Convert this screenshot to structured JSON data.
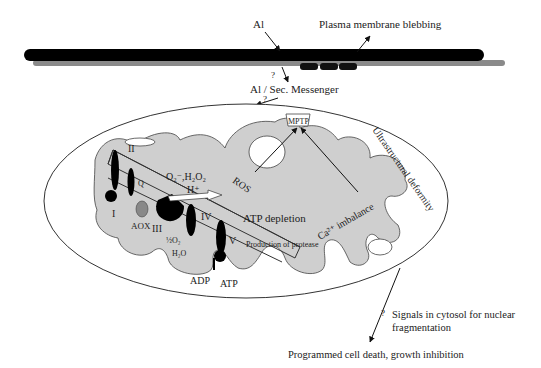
{
  "labels": {
    "al": "Al",
    "plasma_membrane_blebbing": "Plasma membrane blebbing",
    "q1": "?",
    "al_sec_messenger": "Al / Sec. Messenger",
    "q2": "?",
    "mptp": "MPTP",
    "ultrastructural_deformity": "Ultrastructural deformity",
    "ros": "ROS",
    "superoxide_h2o2": "O₂⁻,H₂O₂",
    "h_plus": "H⁺",
    "atp_depletion": "ATP depletion",
    "ca_imbalance": "Ca²⁺ imbalance",
    "production_of_protease": "Production of protease",
    "complex_I": "I",
    "complex_II": "II",
    "complex_III": "III",
    "complex_IV": "IV",
    "complex_V": "V",
    "q": "Q",
    "aox": "AOX",
    "half_o2": "½O₂",
    "h2o": "H₂O",
    "adp": "ADP",
    "atp": "ATP",
    "q3": "?",
    "signals_line1": "Signals in cytosol for nuclear",
    "signals_line2": "fragmentation",
    "outcome": "Programmed cell death, growth inhibition"
  },
  "colors": {
    "membrane": "#000000",
    "membrane_inner": "#8a8a8a",
    "cristae_fill": "#cfcfcf",
    "outline": "#333333"
  }
}
